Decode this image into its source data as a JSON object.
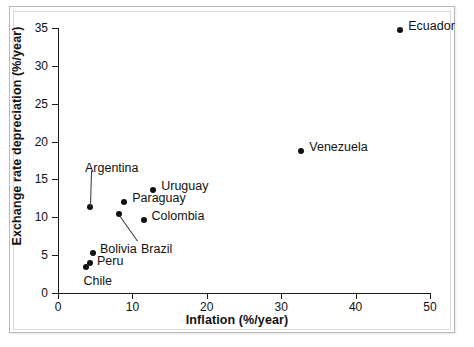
{
  "figure": {
    "background_color": "#ffffff",
    "frame_color": "#b9b9b9",
    "marker_color": "#111111"
  },
  "chart_data": {
    "type": "scatter",
    "title": "",
    "xlabel": "Inflation (%/year)",
    "ylabel": "Exchange rate depreciation (%/year)",
    "xlim": [
      0,
      50
    ],
    "ylim": [
      0,
      35
    ],
    "xticks": [
      0,
      10,
      20,
      30,
      40,
      50
    ],
    "yticks": [
      0,
      5,
      10,
      15,
      20,
      25,
      30,
      35
    ],
    "xtick_labels": [
      "0",
      "10",
      "20",
      "30",
      "40",
      "50"
    ],
    "ytick_labels": [
      "0",
      "5",
      "10",
      "15",
      "20",
      "25",
      "30",
      "35"
    ],
    "grid": false,
    "legend": "none",
    "points": [
      {
        "name": "Ecuador",
        "x": 46.0,
        "y": 34.8,
        "label": "Ecuador",
        "label_dx": 8,
        "label_dy": -5,
        "leader": false
      },
      {
        "name": "Venezuela",
        "x": 32.7,
        "y": 18.7,
        "label": "Venezuela",
        "label_dx": 8,
        "label_dy": -5,
        "leader": false
      },
      {
        "name": "Uruguay",
        "x": 12.8,
        "y": 13.6,
        "label": "Uruguay",
        "label_dx": 8,
        "label_dy": -5,
        "leader": false
      },
      {
        "name": "Paraguay",
        "x": 8.9,
        "y": 12.0,
        "label": "Paraguay",
        "label_dx": 8,
        "label_dy": -5,
        "leader": false
      },
      {
        "name": "Colombia",
        "x": 11.5,
        "y": 9.6,
        "label": "Colombia",
        "label_dx": 8,
        "label_dy": -5,
        "leader": false
      },
      {
        "name": "Brazil",
        "x": 8.2,
        "y": 10.5,
        "label": "Brazil",
        "label_dx": 22,
        "label_dy": 34,
        "leader": true
      },
      {
        "name": "Argentina",
        "x": 4.3,
        "y": 11.4,
        "label": "Argentina",
        "label_dx": -5,
        "label_dy": -40,
        "leader": true
      },
      {
        "name": "Bolivia",
        "x": 4.7,
        "y": 5.3,
        "label": "Bolivia",
        "label_dx": 7,
        "label_dy": -5,
        "leader": false
      },
      {
        "name": "Peru",
        "x": 4.3,
        "y": 3.9,
        "label": "Peru",
        "label_dx": 7,
        "label_dy": -3,
        "leader": false
      },
      {
        "name": "Chile",
        "x": 3.7,
        "y": 3.4,
        "label": "Chile",
        "label_dx": -2,
        "label_dy": 13,
        "leader": false
      }
    ]
  }
}
